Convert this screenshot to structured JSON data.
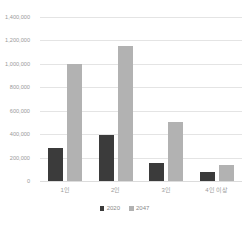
{
  "chart_data": {
    "type": "bar",
    "title": "",
    "xlabel": "",
    "ylabel": "",
    "categories": [
      "1인",
      "2인",
      "3인",
      "4인 이상"
    ],
    "series": [
      {
        "name": "2020",
        "color": "#3b3b3b",
        "values": [
          280000,
          390000,
          155000,
          75000
        ]
      },
      {
        "name": "2047",
        "color": "#b2b2b2",
        "values": [
          1000000,
          1150000,
          500000,
          140000
        ]
      }
    ],
    "ylim": [
      0,
      1400000
    ],
    "ytick_values": [
      0,
      200000,
      400000,
      600000,
      800000,
      1000000,
      1200000,
      1400000
    ],
    "ytick_labels": [
      "0",
      "200,000",
      "400,000",
      "600,000",
      "800,000",
      "1,000,000",
      "1,200,000",
      "1,400,000"
    ],
    "grid": true,
    "legend_position": "bottom",
    "legend_entries": [
      {
        "label": "2020",
        "color": "#3b3b3b"
      },
      {
        "label": "2047",
        "color": "#b2b2b2"
      }
    ]
  },
  "colors": {
    "series_2020": "#3b3b3b",
    "series_2047": "#b2b2b2",
    "gridline": "#e4e4e4",
    "tick_text": "#9a9a9a",
    "background": "#ffffff"
  }
}
